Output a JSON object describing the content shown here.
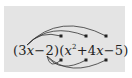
{
  "diagram": {
    "expression": {
      "open1": "(",
      "term_3x_coef": "3",
      "var": "x",
      "minus2": "−2",
      "close_open": ")(",
      "x2_var": "x",
      "x2_exp": "2",
      "plus4": "+4",
      "var2": "x",
      "minus5": "−5",
      "close2": ")"
    },
    "arrows": {
      "from_3x_to": [
        "x²",
        "4x",
        "−5"
      ],
      "from_neg2_to": [
        "x²",
        "4x",
        "−5"
      ]
    },
    "colors": {
      "background": "#e4e4e4",
      "ink": "#222222"
    }
  }
}
